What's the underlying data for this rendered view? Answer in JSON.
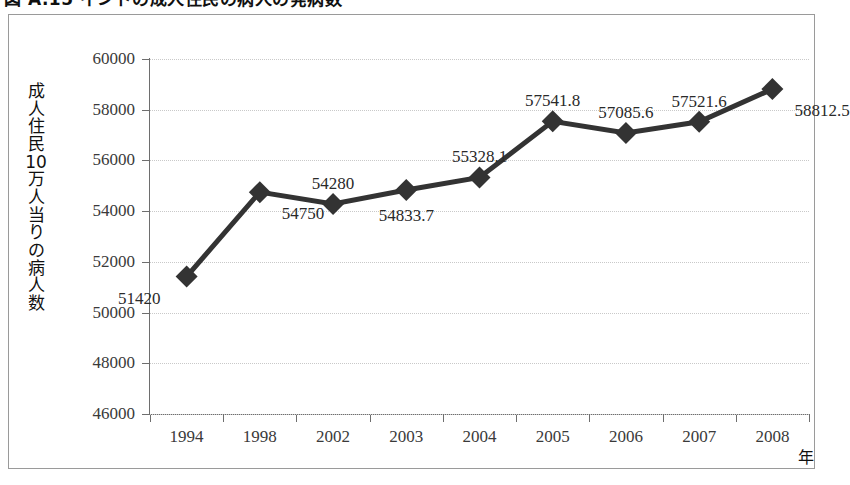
{
  "caption": {
    "text": "図 A.15    インドの成人住民の病人の発病数"
  },
  "chart_data": {
    "type": "line",
    "title": "",
    "xlabel": "年",
    "ylabel": "成人住民10万人当りの病人数",
    "categories": [
      "1994",
      "1998",
      "2002",
      "2003",
      "2004",
      "2005",
      "2006",
      "2007",
      "2008"
    ],
    "values": [
      51420,
      54750,
      54280,
      54833.7,
      55328.1,
      57541.8,
      57085.6,
      57521.6,
      58812.5
    ],
    "point_labels": [
      "51420",
      "54750",
      "54280",
      "54833.7",
      "55328.1",
      "57541.8",
      "57085.6",
      "57521.6",
      "58812.5"
    ],
    "label_positions": [
      "below-left",
      "below-right",
      "above",
      "below",
      "above",
      "above",
      "above",
      "above",
      "below-right"
    ],
    "ylim": [
      46000,
      60000
    ],
    "yticks": [
      46000,
      48000,
      50000,
      52000,
      54000,
      56000,
      58000,
      60000
    ],
    "ytick_labels": [
      "46000",
      "48000",
      "50000",
      "52000",
      "54000",
      "56000",
      "58000",
      "60000"
    ],
    "grid": true,
    "grid_style": "dotted",
    "legend": "none",
    "series_color": "#333333",
    "marker": "diamond",
    "marker_size": 11,
    "line_width": 5
  }
}
